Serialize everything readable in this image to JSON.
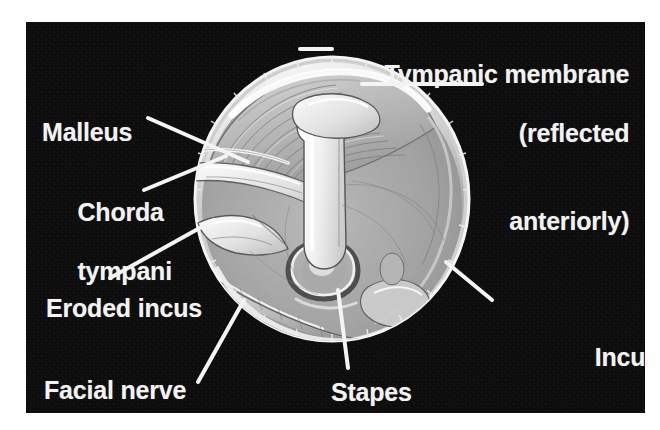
{
  "figure": {
    "kind": "anatomical-illustration",
    "background_color": "#ffffff",
    "panel_color": "#0a0a0a",
    "label_color": "#f2f2f2"
  },
  "labels": {
    "tympanic_membrane": {
      "line1": "Tympanic membrane",
      "line2": "(reflected",
      "line3": "anteriorly)"
    },
    "malleus": "Malleus",
    "chorda_tympani": {
      "line1": "Chorda",
      "line2": "tympani"
    },
    "eroded_incus": "Eroded incus",
    "facial_nerve": "Facial nerve",
    "stapes": "Stapes",
    "incus_replacement_prosthesis": {
      "line1": "Incus",
      "line2": "replacement",
      "line3": "prosthesis"
    }
  },
  "structures": [
    {
      "name": "tympanic-membrane",
      "label": "Tympanic membrane (reflected anteriorly)"
    },
    {
      "name": "malleus",
      "label": "Malleus"
    },
    {
      "name": "chorda-tympani",
      "label": "Chorda tympani"
    },
    {
      "name": "eroded-incus",
      "label": "Eroded incus"
    },
    {
      "name": "facial-nerve",
      "label": "Facial nerve"
    },
    {
      "name": "stapes",
      "label": "Stapes"
    },
    {
      "name": "incus-replacement-prosthesis",
      "label": "Incus replacement prosthesis"
    }
  ]
}
